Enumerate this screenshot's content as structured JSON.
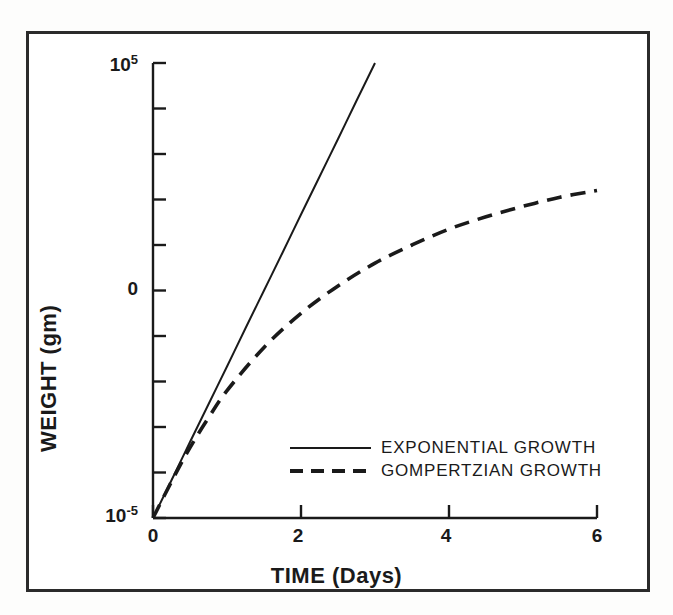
{
  "chart_data": {
    "type": "line",
    "title": "",
    "xlabel": "TIME (Days)",
    "ylabel": "WEIGHT (gm)",
    "xlim": [
      0,
      6
    ],
    "ylim": [
      -5,
      5
    ],
    "y_scale": "log10",
    "grid": false,
    "legend_position": "center-right-inside",
    "x_ticks": [
      {
        "value": 0,
        "label": "0"
      },
      {
        "value": 1,
        "label": ""
      },
      {
        "value": 2,
        "label": "2"
      },
      {
        "value": 3,
        "label": ""
      },
      {
        "value": 4,
        "label": "4"
      },
      {
        "value": 5,
        "label": ""
      },
      {
        "value": 6,
        "label": "6"
      }
    ],
    "y_ticks": [
      {
        "value": 5,
        "label": "10",
        "exponent": "5"
      },
      {
        "value": 4,
        "label": "",
        "exponent": ""
      },
      {
        "value": 3,
        "label": "",
        "exponent": ""
      },
      {
        "value": 2,
        "label": "",
        "exponent": ""
      },
      {
        "value": 1,
        "label": "",
        "exponent": ""
      },
      {
        "value": 0,
        "label": "0",
        "exponent": ""
      },
      {
        "value": -1,
        "label": "",
        "exponent": ""
      },
      {
        "value": -2,
        "label": "",
        "exponent": ""
      },
      {
        "value": -3,
        "label": "",
        "exponent": ""
      },
      {
        "value": -4,
        "label": "",
        "exponent": ""
      },
      {
        "value": -5,
        "label": "10",
        "exponent": "-5"
      }
    ],
    "series": [
      {
        "name": "EXPONENTIAL GROWTH",
        "style": "solid",
        "color": "#1a1a1a",
        "x": [
          0,
          0.25,
          0.5,
          0.75,
          1,
          1.25,
          1.5,
          1.75,
          2,
          2.25,
          2.5,
          2.75,
          3
        ],
        "y": [
          -5,
          -4.17,
          -3.33,
          -2.5,
          -1.67,
          -0.83,
          0,
          0.83,
          1.67,
          2.5,
          3.33,
          4.17,
          5
        ]
      },
      {
        "name": "GOMPERTZIAN GROWTH",
        "style": "dashed",
        "color": "#1a1a1a",
        "x": [
          0,
          0.25,
          0.5,
          0.75,
          1,
          1.5,
          2,
          2.5,
          3,
          3.5,
          4,
          4.5,
          5,
          5.5,
          6
        ],
        "y": [
          -5,
          -4.2,
          -3.45,
          -2.8,
          -2.2,
          -1.25,
          -0.5,
          0.1,
          0.6,
          1.0,
          1.35,
          1.62,
          1.85,
          2.05,
          2.2
        ]
      }
    ]
  },
  "legend": {
    "entries": [
      {
        "label": "EXPONENTIAL GROWTH",
        "style": "solid"
      },
      {
        "label": "GOMPERTZIAN GROWTH",
        "style": "dashed"
      }
    ]
  },
  "axes": {
    "x_title": "TIME (Days)",
    "y_title": "WEIGHT (gm)"
  }
}
